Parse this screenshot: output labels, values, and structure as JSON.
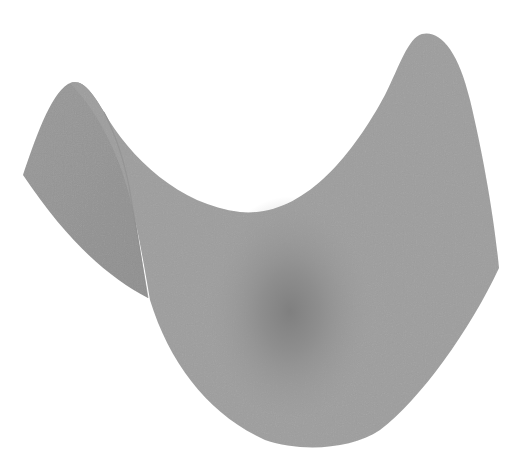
{
  "image": {
    "subject": "saddle surface (hyperbolic paraboloid)",
    "description": "3D rendered gray saddle-shaped surface on white background",
    "colors": {
      "background": "#ffffff",
      "surface": "#9c9c9c",
      "surface_back_fold": "#959595",
      "shadow": "#7a7a7a",
      "highlight": "#a6a6a6"
    }
  }
}
